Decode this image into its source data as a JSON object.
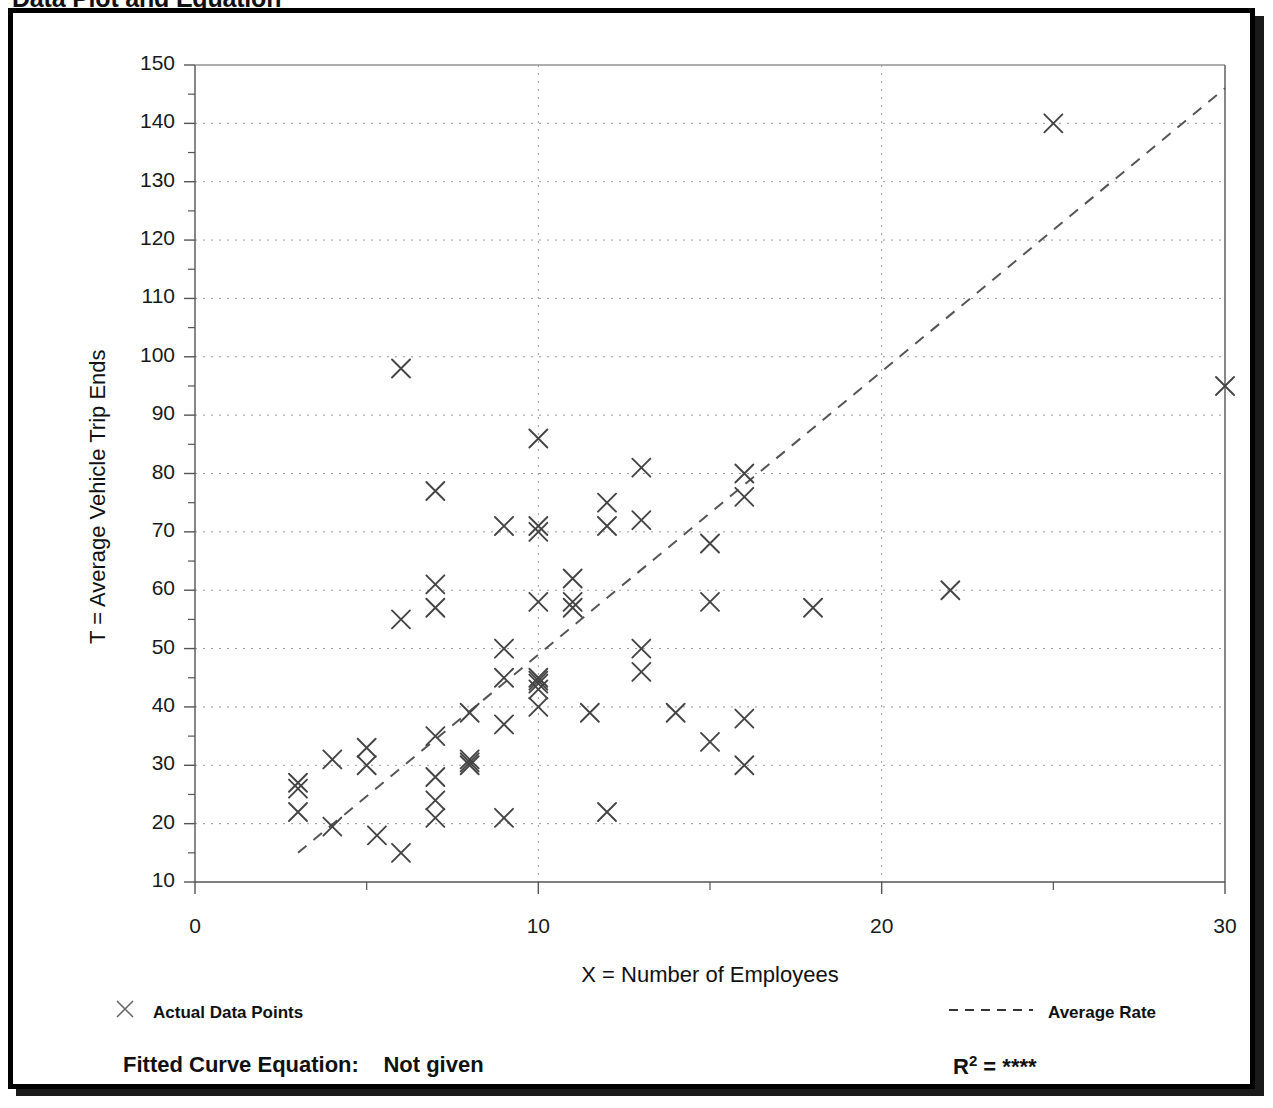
{
  "page_title": "Data Plot and Equation",
  "chart_data": {
    "type": "scatter",
    "title": "Data Plot and Equation",
    "xlabel": "X = Number of Employees",
    "ylabel": "T = Average Vehicle Trip Ends",
    "xlim": [
      0,
      30
    ],
    "ylim": [
      10,
      150
    ],
    "x_major_ticks": [
      0,
      10,
      20,
      30
    ],
    "x_minor_ticks": [
      5,
      15,
      25
    ],
    "y_ticks": [
      10,
      20,
      30,
      40,
      50,
      60,
      70,
      80,
      90,
      100,
      110,
      120,
      130,
      140,
      150
    ],
    "y_minor_ticks": [
      15,
      25,
      35,
      45,
      55,
      65,
      75,
      85,
      95,
      105,
      115,
      125,
      135,
      145
    ],
    "grid": "dotted",
    "legend_position": "below-axes",
    "marker": "x",
    "series": [
      {
        "name": "Actual Data Points",
        "marker": "x",
        "points": [
          [
            3,
            27
          ],
          [
            3,
            26
          ],
          [
            3,
            22
          ],
          [
            4,
            31
          ],
          [
            4,
            19.5
          ],
          [
            5,
            33
          ],
          [
            5,
            30
          ],
          [
            5.3,
            18
          ],
          [
            6,
            98
          ],
          [
            6,
            55
          ],
          [
            6,
            15
          ],
          [
            7,
            77
          ],
          [
            7,
            61
          ],
          [
            7,
            57
          ],
          [
            7,
            35
          ],
          [
            7,
            28
          ],
          [
            7,
            24
          ],
          [
            7,
            21
          ],
          [
            8,
            39
          ],
          [
            8,
            31
          ],
          [
            8,
            30.5
          ],
          [
            8,
            30
          ],
          [
            9,
            71
          ],
          [
            9,
            50
          ],
          [
            9,
            45
          ],
          [
            9,
            37
          ],
          [
            9,
            21
          ],
          [
            10,
            86
          ],
          [
            10,
            71
          ],
          [
            10,
            70
          ],
          [
            10,
            58
          ],
          [
            10,
            45
          ],
          [
            10,
            44.5
          ],
          [
            10,
            44
          ],
          [
            10,
            43
          ],
          [
            10,
            40
          ],
          [
            11,
            62
          ],
          [
            11,
            58
          ],
          [
            11,
            57
          ],
          [
            11.5,
            39
          ],
          [
            12,
            75
          ],
          [
            12,
            71
          ],
          [
            12,
            22
          ],
          [
            13,
            81
          ],
          [
            13,
            72
          ],
          [
            13,
            50
          ],
          [
            13,
            46
          ],
          [
            14,
            39
          ],
          [
            15,
            68
          ],
          [
            15,
            58
          ],
          [
            15,
            34
          ],
          [
            16,
            80
          ],
          [
            16,
            76
          ],
          [
            16,
            38
          ],
          [
            16,
            30
          ],
          [
            18,
            57
          ],
          [
            22,
            60
          ],
          [
            25,
            140
          ],
          [
            30,
            95
          ]
        ]
      }
    ],
    "trendline": {
      "name": "Average Rate",
      "style": "dashed",
      "x_start": 3.0,
      "y_start": 15,
      "x_end": 30,
      "y_end": 146
    }
  },
  "axis": {
    "y_tick_labels": [
      "150",
      "140",
      "130",
      "120",
      "110",
      "100",
      "90",
      "80",
      "70",
      "60",
      "50",
      "40",
      "30",
      "20",
      "10"
    ],
    "x_tick_labels": [
      "0",
      "10",
      "20",
      "30"
    ],
    "y_title": "T = Average Vehicle Trip Ends",
    "x_title": "X = Number of Employees"
  },
  "legend": {
    "data_points_label": "Actual Data Points",
    "data_points_marker": "x-marker-icon",
    "average_rate_label": "Average Rate",
    "average_rate_marker": "dashed-line-icon"
  },
  "footer": {
    "equation_label": "Fitted Curve Equation:",
    "equation_value": "Not given",
    "r2_label": "R",
    "r2_exponent": "2",
    "r2_equals": "=",
    "r2_value": "****"
  },
  "colors": {
    "frame": "#000000",
    "axis": "#555555",
    "grid": "#999999",
    "marker": "#444444",
    "trendline": "#555555",
    "text": "#111111",
    "background": "#ffffff"
  }
}
